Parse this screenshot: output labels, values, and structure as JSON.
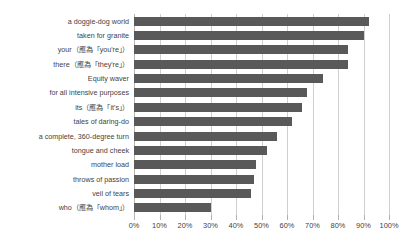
{
  "chart_data": {
    "type": "bar",
    "orientation": "horizontal",
    "title": "",
    "subtitle": "",
    "xlabel": "",
    "ylabel": "",
    "xlim": [
      0,
      100
    ],
    "grid": true,
    "legend": false,
    "legend_position": "none",
    "bar_color": "#595959",
    "gridline_color": "#cfcfcf",
    "text_color": "#3f3f3f",
    "value_suffix": "%",
    "xticks": [
      0,
      10,
      20,
      30,
      40,
      50,
      60,
      70,
      80,
      90,
      100
    ],
    "xtick_labels": [
      "0%",
      "10%",
      "20%",
      "30%",
      "40%",
      "50%",
      "60%",
      "70%",
      "80%",
      "90%",
      "100%"
    ],
    "categories": [
      "a doggie-dog world",
      "taken for granite",
      "your（應為「you're」）",
      "there（應為「they're」）",
      "Equity waver",
      "for all intensive purposes",
      "its（應為「it's」）",
      "tales of daring-do",
      "a complete, 360-degree turn",
      "tongue and cheek",
      "mother load",
      "throws of passion",
      "veil of tears",
      "who（應為「whom」）"
    ],
    "values": [
      92,
      90,
      84,
      84,
      74,
      68,
      66,
      62,
      56,
      52,
      48,
      47,
      46,
      30
    ]
  }
}
